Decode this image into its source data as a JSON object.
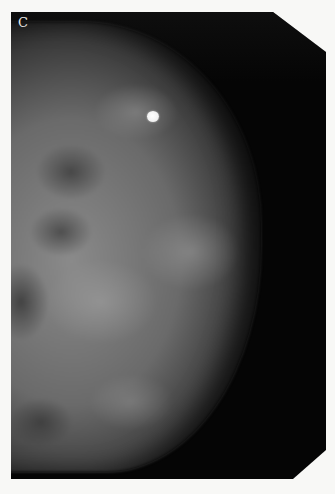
{
  "image": {
    "description": "Mammogram film (craniocaudal-style view) of breast tissue with a bright round skin marker",
    "panel_label": "C",
    "colors": {
      "film_background": "#050505",
      "page_background": "#f8f8f6",
      "tissue_mid": "#8a8a8a",
      "marker": "#ffffff"
    },
    "marker": {
      "shape": "circle",
      "approx_position_px": [
        142,
        117
      ]
    }
  }
}
